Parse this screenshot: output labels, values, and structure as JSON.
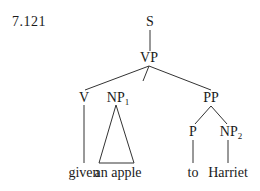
{
  "example_number": "7.121",
  "tree": {
    "root": "S",
    "nodes": {
      "s": {
        "label": "S"
      },
      "vp": {
        "label": "VP"
      },
      "v": {
        "label": "V"
      },
      "np1": {
        "label": "NP",
        "subscript": "1"
      },
      "pp": {
        "label": "PP"
      },
      "p": {
        "label": "P"
      },
      "np2": {
        "label": "NP",
        "subscript": "2"
      }
    },
    "leaves": {
      "given": "given",
      "an_apple": "an apple",
      "to": "to",
      "harriet": "Harriet"
    },
    "structure": "[S [VP [V given] [NP1 an apple] [PP [P to] [NP2 Harriet]]]]",
    "line_color": "#333333"
  }
}
